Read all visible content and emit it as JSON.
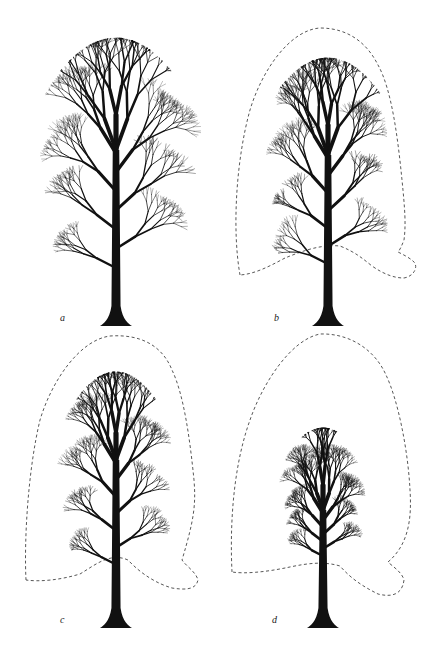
{
  "figure": {
    "panels": [
      {
        "id": "a",
        "label": "a",
        "description": "Full tree crown, no outline",
        "has_outline": false,
        "crown_scale": 1.0
      },
      {
        "id": "b",
        "label": "b",
        "description": "Crown reduced, original crown outline dashed",
        "has_outline": true,
        "crown_scale": 0.88
      },
      {
        "id": "c",
        "label": "c",
        "description": "Crown further reduced, original outline dashed",
        "has_outline": true,
        "crown_scale": 0.8
      },
      {
        "id": "d",
        "label": "d",
        "description": "Crown heavily reduced, original outline dashed",
        "has_outline": true,
        "crown_scale": 0.62
      }
    ],
    "colors": {
      "ink": "#111111",
      "outline": "#444444",
      "background": "#ffffff"
    }
  }
}
